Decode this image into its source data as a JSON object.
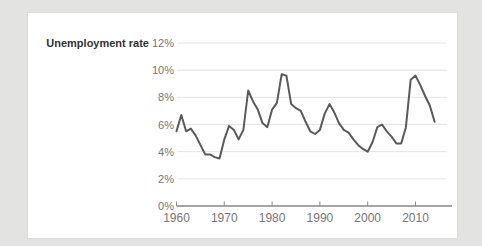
{
  "page": {
    "background_color": "#e3e3e1",
    "card_background": "#ffffff",
    "card_border_color": "#dcdcda"
  },
  "chart_title": "Unemployment rate",
  "chart_data": {
    "type": "line",
    "title": "Unemployment rate",
    "xlabel": "",
    "ylabel": "",
    "ylim": [
      0,
      12
    ],
    "xlim": [
      1960,
      2017.5
    ],
    "grid": true,
    "y_ticks": [
      "12%",
      "10%",
      "8%",
      "6%",
      "4%",
      "2%",
      "0%"
    ],
    "y_tick_values": [
      12,
      10,
      8,
      6,
      4,
      2,
      0
    ],
    "x_ticks": [
      "1960",
      "1970",
      "1980",
      "1990",
      "2000",
      "2010"
    ],
    "x_tick_values": [
      1960,
      1970,
      1980,
      1990,
      2000,
      2010
    ],
    "x": [
      1960,
      1961,
      1962,
      1963,
      1964,
      1965,
      1966,
      1967,
      1968,
      1969,
      1970,
      1971,
      1972,
      1973,
      1974,
      1975,
      1976,
      1977,
      1978,
      1979,
      1980,
      1981,
      1982,
      1983,
      1984,
      1985,
      1986,
      1987,
      1988,
      1989,
      1990,
      1991,
      1992,
      1993,
      1994,
      1995,
      1996,
      1997,
      1998,
      1999,
      2000,
      2001,
      2002,
      2003,
      2004,
      2005,
      2006,
      2007,
      2008,
      2009,
      2010,
      2011,
      2012,
      2013,
      2014
    ],
    "values": [
      5.5,
      6.7,
      5.5,
      5.7,
      5.2,
      4.5,
      3.8,
      3.8,
      3.6,
      3.5,
      4.9,
      5.9,
      5.6,
      4.9,
      5.6,
      8.5,
      7.7,
      7.1,
      6.1,
      5.8,
      7.1,
      7.6,
      9.7,
      9.6,
      7.5,
      7.2,
      7.0,
      6.2,
      5.5,
      5.3,
      5.6,
      6.8,
      7.5,
      6.9,
      6.1,
      5.6,
      5.4,
      4.9,
      4.5,
      4.2,
      4.0,
      4.7,
      5.8,
      6.0,
      5.5,
      5.1,
      4.6,
      4.6,
      5.8,
      9.3,
      9.6,
      8.9,
      8.1,
      7.4,
      6.2
    ],
    "line_color": "#595a5c",
    "grid_color": "#e4e4e3",
    "axis_color": "#4a4a4a",
    "tick_color": "#8c8c8c",
    "label_color": "#767676",
    "title_color": "#333333",
    "legend_position": "none"
  }
}
